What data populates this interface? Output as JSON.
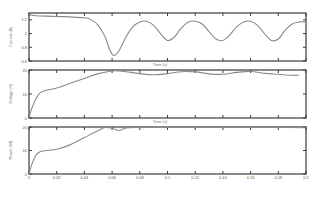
{
  "chart_data": [
    {
      "type": "line",
      "panel": "top",
      "title": "",
      "xlabel": "Time (s)",
      "ylabel": "Current (A)",
      "xlim": [
        0,
        0.2
      ],
      "ylim": [
        0.6,
        1.3
      ],
      "yticks": [
        0.6,
        0.8,
        1,
        1.2
      ],
      "grid": false,
      "x": [
        0,
        0.005,
        0.02,
        0.04,
        0.045,
        0.05,
        0.055,
        0.058,
        0.061,
        0.065,
        0.07,
        0.075,
        0.08,
        0.085,
        0.09,
        0.095,
        0.1,
        0.105,
        0.11,
        0.115,
        0.12,
        0.125,
        0.13,
        0.135,
        0.14,
        0.145,
        0.15,
        0.155,
        0.16,
        0.165,
        0.17,
        0.175,
        0.18,
        0.185,
        0.19,
        0.195,
        0.2
      ],
      "series": [
        {
          "name": "Current",
          "values": [
            1.28,
            1.26,
            1.25,
            1.23,
            1.2,
            1.12,
            0.95,
            0.78,
            0.68,
            0.75,
            0.95,
            1.1,
            1.17,
            1.18,
            1.12,
            1.0,
            0.9,
            0.95,
            1.08,
            1.17,
            1.18,
            1.14,
            1.03,
            0.92,
            0.9,
            0.98,
            1.1,
            1.17,
            1.18,
            1.12,
            1.0,
            0.9,
            0.92,
            1.05,
            1.14,
            1.17,
            1.17
          ]
        }
      ]
    },
    {
      "type": "line",
      "panel": "middle",
      "title": "",
      "xlabel": "Time (s)",
      "ylabel": "Voltage (V)",
      "xlim": [
        0,
        0.2
      ],
      "ylim": [
        0,
        20
      ],
      "yticks": [
        0,
        10,
        20
      ],
      "grid": false,
      "x": [
        0,
        0.002,
        0.005,
        0.008,
        0.012,
        0.02,
        0.03,
        0.04,
        0.05,
        0.06,
        0.065,
        0.07,
        0.08,
        0.09,
        0.1,
        0.11,
        0.12,
        0.13,
        0.14,
        0.15,
        0.16,
        0.17,
        0.18,
        0.19,
        0.195
      ],
      "series": [
        {
          "name": "Voltage",
          "values": [
            0,
            4,
            8,
            10.5,
            11.5,
            12.5,
            14.5,
            16.5,
            18.5,
            19.6,
            19.6,
            19.3,
            18.5,
            18.0,
            18.5,
            19.3,
            19.2,
            18.4,
            18.2,
            19.0,
            19.4,
            18.6,
            18.2,
            17.8,
            17.8
          ]
        }
      ]
    },
    {
      "type": "line",
      "panel": "bottom",
      "title": "",
      "xlabel": "Time (s)",
      "ylabel": "Power (W)",
      "xlim": [
        0,
        0.2
      ],
      "ylim": [
        0,
        20
      ],
      "yticks": [
        0,
        10,
        20
      ],
      "xticks": [
        0,
        0.02,
        0.04,
        0.06,
        0.08,
        0.1,
        0.12,
        0.14,
        0.16,
        0.18,
        0.2
      ],
      "grid": false,
      "x": [
        0,
        0.002,
        0.005,
        0.008,
        0.012,
        0.02,
        0.03,
        0.04,
        0.05,
        0.055,
        0.06,
        0.065,
        0.07,
        0.08,
        0.1,
        0.12,
        0.14,
        0.16,
        0.18,
        0.2
      ],
      "series": [
        {
          "name": "Power",
          "values": [
            0,
            4,
            8,
            9.5,
            10.0,
            10.5,
            12.5,
            15.5,
            18.5,
            19.8,
            19.5,
            18.5,
            19.6,
            19.8,
            19.8,
            19.8,
            19.8,
            19.8,
            19.8,
            19.7
          ]
        }
      ]
    }
  ],
  "labels": {
    "xlabel_top": "Time (s)",
    "xlabel_mid": "Time (s)",
    "ylabel_top": "Current (A)",
    "ylabel_mid": "Voltage (V)",
    "ylabel_bot": "Power (W)",
    "xticks": [
      "0",
      "0.02",
      "0.04",
      "0.06",
      "0.08",
      "0.1",
      "0.12",
      "0.14",
      "0.16",
      "0.18",
      "0.2"
    ],
    "yticks_top": [
      "0.6",
      "0.8",
      "1",
      "1.2"
    ],
    "yticks_mid": [
      "0",
      "10",
      "20"
    ],
    "yticks_bot": [
      "0",
      "10",
      "20"
    ]
  }
}
